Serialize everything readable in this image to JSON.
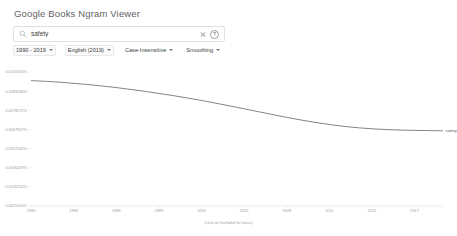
{
  "header": {
    "title": "Google Books Ngram Viewer"
  },
  "search": {
    "icon": "search-icon",
    "value": "safety",
    "placeholder": "",
    "clear_icon": "close-icon",
    "help_icon": "help-circle-icon",
    "help_glyph": "?"
  },
  "filters": [
    {
      "name": "year-range",
      "label": "1990 - 2019"
    },
    {
      "name": "corpus",
      "label": "English (2019)"
    },
    {
      "name": "case-sensitivity",
      "label": "Case-Insensitive"
    },
    {
      "name": "smoothing",
      "label": "Smoothing"
    }
  ],
  "chart_data": {
    "type": "line",
    "title": "",
    "subtitle": "",
    "xlabel": "",
    "ylabel": "",
    "caption": "(click on line/label for focus)",
    "grid": false,
    "legend_position": "line-end",
    "xlim": [
      1990,
      2019
    ],
    "ylim": [
      0.0025,
      0.01
    ],
    "x": [
      1990,
      1992,
      1994,
      1996,
      1998,
      2000,
      2002,
      2004,
      2006,
      2008,
      2010,
      2012,
      2014,
      2016,
      2018,
      2019
    ],
    "xticks": [
      1990,
      1993,
      1996,
      1999,
      2002,
      2005,
      2008,
      2011,
      2014,
      2017
    ],
    "xtick_labels": [
      "1990",
      "1993",
      "1996",
      "1999",
      "2002",
      "2005",
      "2008",
      "2011",
      "2014",
      "2017"
    ],
    "yticks": [
      0.01,
      0.0089286,
      0.0078571,
      0.0067857,
      0.0057143,
      0.0046429,
      0.0035714,
      0.0025
    ],
    "ytick_labels": [
      "0.0100000%",
      "0.0089286%",
      "0.0078571%",
      "0.0067857%",
      "0.0057143%",
      "0.0046429%",
      "0.0035714%",
      "0.0025000%"
    ],
    "series": [
      {
        "name": "safety",
        "color": "#5f6368",
        "values": [
          0.00952,
          0.00943,
          0.0093,
          0.00913,
          0.00892,
          0.00868,
          0.00841,
          0.0081,
          0.00778,
          0.00746,
          0.00718,
          0.00696,
          0.00682,
          0.00675,
          0.00672,
          0.00671
        ]
      }
    ]
  }
}
